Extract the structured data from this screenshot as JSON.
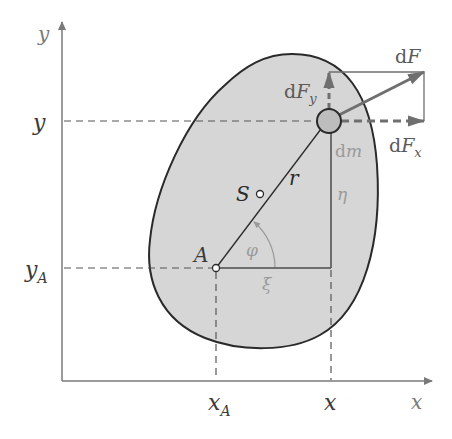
{
  "colors": {
    "axis": "#7a7a7a",
    "body_fill": "#d6d6d6",
    "outline": "#2a2a2a",
    "force": "#6f6f6f",
    "dim_label": "#9a9a9a",
    "label": "#3a3a3a"
  },
  "axes": {
    "x_label": "x",
    "y_label": "y"
  },
  "ticks": {
    "y": "y",
    "y_A": "y",
    "y_A_sub": "A",
    "x": "x",
    "x_A": "x",
    "x_A_sub": "A"
  },
  "points": {
    "A": "A",
    "S": "S"
  },
  "vectors": {
    "r": "r",
    "dF_d": "d",
    "dF_F": "F",
    "dFy_d": "d",
    "dFy_F": "F",
    "dFy_sub": "y",
    "dFx_d": "d",
    "dFx_F": "F",
    "dFx_sub": "x"
  },
  "element": {
    "dm_d": "d",
    "dm_m": "m"
  },
  "dimensions": {
    "xi": "ξ",
    "eta": "η",
    "phi": "φ"
  }
}
